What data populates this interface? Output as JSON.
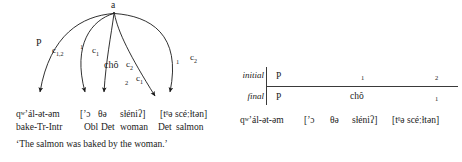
{
  "diagram": {
    "root_node_label": "a",
    "arcs": [
      {
        "id": "arc-p",
        "relation": "P",
        "coord": "c",
        "coord_sub": "1,2",
        "stratum": ""
      },
      {
        "id": "arc-1a",
        "relation": "",
        "coord": "c",
        "coord_sub": "1",
        "stratum": "1"
      },
      {
        "id": "arc-cho",
        "relation": "chô",
        "coord": "c",
        "coord_sub": "2",
        "stratum": ""
      },
      {
        "id": "arc-1b",
        "relation": "",
        "coord": "c",
        "coord_sub": "1",
        "stratum": "2"
      },
      {
        "id": "arc-2",
        "relation": "",
        "coord": "c",
        "coord_sub": "2",
        "stratum": "1"
      }
    ],
    "labels": {
      "p": "P",
      "cho": "chô",
      "c_1_2": "c",
      "c_1_2_sub": "1,2",
      "c_1": "c",
      "c_1_sub": "1",
      "c_2": "c",
      "c_2_sub": "2",
      "stratum_1": "1",
      "stratum_2": "2"
    }
  },
  "gloss": {
    "surface": [
      {
        "text": "qʷʼál-ət-əm",
        "prefix": "q",
        "modifier": "W",
        "rest": "ʼál-ət-əm"
      },
      {
        "text": "[ʼɔ"
      },
      {
        "text": "θə"
      },
      {
        "text": "sɫéniʔ]"
      },
      {
        "text": "[tᶿə scéːɫtən]"
      }
    ],
    "surface_items": [
      "qʷʼál-ət-əm",
      "[ʼɔ",
      "θə",
      "sɫéniʔ]",
      "[tᶿə scéːɫtən]"
    ],
    "morphemes": [
      "bake-Tr-Intr",
      "Obl",
      "Det",
      "woman",
      "Det",
      "salmon"
    ],
    "translation": "‘The salmon was baked by the woman.’"
  },
  "strata": {
    "row_labels": {
      "initial": "initial",
      "final": "final"
    },
    "columns": [
      "col1",
      "col2",
      "col3"
    ],
    "initial_row": [
      {
        "value": "P",
        "small": false
      },
      {
        "value": "1",
        "small": true
      },
      {
        "value": "2",
        "small": true
      }
    ],
    "final_row": [
      {
        "value": "P",
        "small": false
      },
      {
        "value": "chô",
        "small": false
      },
      {
        "value": "1",
        "small": true
      }
    ],
    "gloss_items": [
      "qʷʼál-ət-əm",
      "[ʼɔ",
      "θə",
      "sɫéniʔ]",
      "[tᶿə scéːɫtən]"
    ]
  },
  "colors": {
    "ink": "#1a1a1a",
    "rule": "#3a3a3a",
    "background": "#ffffff"
  }
}
